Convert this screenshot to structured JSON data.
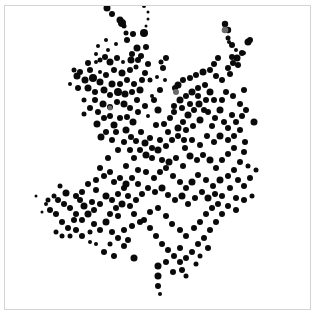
{
  "chart_data": {
    "type": "scatter",
    "title": "",
    "xlabel": "",
    "ylabel": "",
    "grid": false,
    "legend": null,
    "axes_visible": false,
    "frame": {
      "x": 4,
      "y": 5,
      "width": 307,
      "height": 305,
      "border_color": "#d4d4d4"
    },
    "marker_color": "#0a0a0a",
    "highlight_color": "#6a6a6a",
    "xlim": [
      0,
      317
    ],
    "ylim": [
      0,
      315
    ],
    "points": [
      [
        107,
        8,
        3.5
      ],
      [
        112,
        14,
        3
      ],
      [
        120,
        20,
        3.5
      ],
      [
        124,
        26,
        2.5
      ],
      [
        144,
        6,
        2
      ],
      [
        148,
        12,
        1.5
      ],
      [
        148,
        19,
        1.5
      ],
      [
        146,
        26,
        1.5
      ],
      [
        122,
        23,
        4
      ],
      [
        144,
        33,
        4
      ],
      [
        127,
        40,
        3
      ],
      [
        126,
        33,
        2.5
      ],
      [
        133,
        34,
        3
      ],
      [
        137,
        48,
        3.5
      ],
      [
        146,
        47,
        3
      ],
      [
        141,
        56,
        3
      ],
      [
        132,
        54,
        3
      ],
      [
        131,
        60,
        3.5
      ],
      [
        138,
        60,
        3
      ],
      [
        148,
        64,
        3
      ],
      [
        123,
        62,
        2
      ],
      [
        98,
        46,
        2
      ],
      [
        108,
        50,
        2
      ],
      [
        117,
        58,
        3
      ],
      [
        96,
        62,
        2
      ],
      [
        80,
        72,
        3
      ],
      [
        77,
        76,
        3.5
      ],
      [
        88,
        63,
        3
      ],
      [
        90,
        70,
        3
      ],
      [
        100,
        60,
        2.5
      ],
      [
        105,
        57,
        3
      ],
      [
        110,
        62,
        3.5
      ],
      [
        114,
        70,
        3
      ],
      [
        122,
        73,
        3.5
      ],
      [
        130,
        70,
        3
      ],
      [
        136,
        67,
        2.5
      ],
      [
        145,
        73,
        3
      ],
      [
        142,
        80,
        3
      ],
      [
        150,
        80,
        2.5
      ],
      [
        85,
        80,
        3.5
      ],
      [
        93,
        78,
        4
      ],
      [
        100,
        82,
        3.5
      ],
      [
        106,
        75,
        3
      ],
      [
        112,
        84,
        3.5
      ],
      [
        120,
        84,
        3
      ],
      [
        127,
        80,
        3
      ],
      [
        134,
        84,
        3
      ],
      [
        88,
        88,
        3.5
      ],
      [
        95,
        92,
        3
      ],
      [
        104,
        90,
        3.5
      ],
      [
        110,
        95,
        3
      ],
      [
        118,
        92,
        4
      ],
      [
        125,
        94,
        3.5
      ],
      [
        132,
        92,
        3
      ],
      [
        140,
        90,
        3.5
      ],
      [
        95,
        100,
        3
      ],
      [
        103,
        104,
        3.5
      ],
      [
        110,
        107,
        3
      ],
      [
        117,
        102,
        3
      ],
      [
        124,
        104,
        3.5
      ],
      [
        130,
        108,
        3
      ],
      [
        137,
        100,
        3
      ],
      [
        98,
        112,
        3
      ],
      [
        104,
        118,
        3
      ],
      [
        97,
        124,
        3.5
      ],
      [
        110,
        116,
        3
      ],
      [
        114,
        125,
        3.5
      ],
      [
        120,
        118,
        3
      ],
      [
        127,
        117,
        3
      ],
      [
        133,
        122,
        3.5
      ],
      [
        138,
        112,
        3
      ],
      [
        145,
        106,
        3
      ],
      [
        101,
        137,
        3.5
      ],
      [
        126,
        130,
        3.5
      ],
      [
        131,
        137,
        3
      ],
      [
        136,
        141,
        3
      ],
      [
        141,
        132,
        3
      ],
      [
        145,
        143,
        3.5
      ],
      [
        150,
        138,
        3
      ],
      [
        140,
        150,
        3
      ],
      [
        146,
        155,
        3.5
      ],
      [
        152,
        158,
        3
      ],
      [
        158,
        150,
        3.5
      ],
      [
        162,
        160,
        3
      ],
      [
        156,
        125,
        3
      ],
      [
        158,
        110,
        3.5
      ],
      [
        154,
        100,
        3
      ],
      [
        160,
        90,
        3
      ],
      [
        163,
        68,
        3
      ],
      [
        161,
        62,
        2.5
      ],
      [
        166,
        58,
        3
      ],
      [
        165,
        80,
        2
      ],
      [
        157,
        77,
        2
      ],
      [
        175,
        88,
        3
      ],
      [
        178,
        85,
        3.5
      ],
      [
        183,
        80,
        3
      ],
      [
        190,
        78,
        3
      ],
      [
        196,
        75,
        3
      ],
      [
        203,
        72,
        3.5
      ],
      [
        210,
        70,
        3
      ],
      [
        214,
        64,
        3
      ],
      [
        218,
        58,
        3
      ],
      [
        216,
        76,
        3
      ],
      [
        222,
        80,
        3
      ],
      [
        228,
        68,
        3
      ],
      [
        233,
        63,
        3
      ],
      [
        237,
        58,
        3.5
      ],
      [
        242,
        53,
        3
      ],
      [
        248,
        42,
        3.5
      ],
      [
        250,
        40,
        3
      ],
      [
        244,
        53,
        2
      ],
      [
        236,
        50,
        2
      ],
      [
        229,
        42,
        2
      ],
      [
        228,
        30,
        3.2
      ],
      [
        225,
        24,
        3.2
      ],
      [
        228,
        38,
        2.5
      ],
      [
        232,
        45,
        3
      ],
      [
        232,
        57,
        3
      ],
      [
        238,
        65,
        3
      ],
      [
        230,
        74,
        3
      ],
      [
        174,
        106,
        3
      ],
      [
        180,
        100,
        3.5
      ],
      [
        186,
        96,
        3
      ],
      [
        192,
        92,
        3.5
      ],
      [
        198,
        88,
        3
      ],
      [
        205,
        85,
        3
      ],
      [
        210,
        92,
        3.5
      ],
      [
        214,
        100,
        3
      ],
      [
        206,
        100,
        3
      ],
      [
        199,
        104,
        3.5
      ],
      [
        194,
        110,
        3
      ],
      [
        188,
        115,
        3.5
      ],
      [
        183,
        122,
        3
      ],
      [
        178,
        128,
        3.5
      ],
      [
        186,
        130,
        3
      ],
      [
        193,
        126,
        3
      ],
      [
        200,
        120,
        3.5
      ],
      [
        208,
        112,
        3
      ],
      [
        215,
        118,
        3
      ],
      [
        220,
        110,
        3.5
      ],
      [
        222,
        100,
        3
      ],
      [
        226,
        92,
        3
      ],
      [
        233,
        96,
        3
      ],
      [
        240,
        104,
        3
      ],
      [
        244,
        90,
        3
      ],
      [
        254,
        122,
        3.5
      ],
      [
        232,
        115,
        3
      ],
      [
        240,
        130,
        3
      ],
      [
        228,
        128,
        3
      ],
      [
        220,
        136,
        3.5
      ],
      [
        214,
        142,
        3
      ],
      [
        207,
        136,
        3
      ],
      [
        200,
        145,
        3
      ],
      [
        192,
        140,
        3
      ],
      [
        185,
        148,
        3
      ],
      [
        190,
        156,
        3.5
      ],
      [
        197,
        160,
        3
      ],
      [
        203,
        155,
        3
      ],
      [
        210,
        160,
        3.5
      ],
      [
        216,
        168,
        3
      ],
      [
        222,
        160,
        3
      ],
      [
        228,
        154,
        3
      ],
      [
        234,
        148,
        3
      ],
      [
        245,
        142,
        3
      ],
      [
        244,
        152,
        3
      ],
      [
        240,
        162,
        3
      ],
      [
        234,
        170,
        3
      ],
      [
        228,
        176,
        3
      ],
      [
        220,
        180,
        3.5
      ],
      [
        213,
        186,
        3
      ],
      [
        206,
        180,
        3
      ],
      [
        198,
        175,
        3
      ],
      [
        192,
        182,
        3.5
      ],
      [
        186,
        188,
        3
      ],
      [
        180,
        182,
        3
      ],
      [
        173,
        176,
        3
      ],
      [
        166,
        168,
        3
      ],
      [
        169,
        162,
        3.5
      ],
      [
        176,
        158,
        3
      ],
      [
        183,
        166,
        3
      ],
      [
        160,
        172,
        3
      ],
      [
        154,
        178,
        3
      ],
      [
        148,
        188,
        3
      ],
      [
        155,
        192,
        3
      ],
      [
        162,
        188,
        3.5
      ],
      [
        168,
        195,
        3
      ],
      [
        175,
        200,
        3
      ],
      [
        182,
        196,
        3.5
      ],
      [
        188,
        204,
        3
      ],
      [
        195,
        198,
        3
      ],
      [
        202,
        192,
        3
      ],
      [
        208,
        198,
        3.5
      ],
      [
        215,
        194,
        3
      ],
      [
        222,
        196,
        3
      ],
      [
        230,
        188,
        3
      ],
      [
        238,
        180,
        3
      ],
      [
        244,
        186,
        3
      ],
      [
        236,
        198,
        3
      ],
      [
        228,
        206,
        3
      ],
      [
        222,
        214,
        3
      ],
      [
        216,
        222,
        3
      ],
      [
        210,
        230,
        3
      ],
      [
        204,
        238,
        3
      ],
      [
        198,
        244,
        3
      ],
      [
        192,
        252,
        3
      ],
      [
        186,
        258,
        3
      ],
      [
        180,
        262,
        3
      ],
      [
        174,
        256,
        3
      ],
      [
        168,
        250,
        3
      ],
      [
        162,
        244,
        3
      ],
      [
        156,
        236,
        3
      ],
      [
        150,
        228,
        3
      ],
      [
        144,
        220,
        3
      ],
      [
        150,
        212,
        3
      ],
      [
        158,
        208,
        3
      ],
      [
        166,
        216,
        3
      ],
      [
        172,
        224,
        3
      ],
      [
        180,
        230,
        3
      ],
      [
        186,
        236,
        3
      ],
      [
        194,
        228,
        3
      ],
      [
        200,
        222,
        3
      ],
      [
        206,
        214,
        3
      ],
      [
        212,
        208,
        3
      ],
      [
        218,
        204,
        3
      ],
      [
        236,
        210,
        3
      ],
      [
        244,
        200,
        3
      ],
      [
        252,
        196,
        2.5
      ],
      [
        256,
        170,
        2.5
      ],
      [
        250,
        178,
        3
      ],
      [
        248,
        166,
        2.5
      ],
      [
        158,
        266,
        3.5
      ],
      [
        158,
        276,
        3.5
      ],
      [
        158,
        286,
        3
      ],
      [
        160,
        294,
        2
      ],
      [
        173,
        272,
        3
      ],
      [
        166,
        262,
        3
      ],
      [
        180,
        248,
        3
      ],
      [
        196,
        264,
        2.5
      ],
      [
        200,
        256,
        2.5
      ],
      [
        208,
        248,
        3
      ],
      [
        186,
        276,
        2.5
      ],
      [
        182,
        270,
        3
      ],
      [
        106,
        222,
        3.5
      ],
      [
        110,
        214,
        3
      ],
      [
        116,
        208,
        3
      ],
      [
        122,
        204,
        3.5
      ],
      [
        128,
        196,
        3
      ],
      [
        124,
        188,
        3
      ],
      [
        118,
        194,
        3
      ],
      [
        112,
        200,
        3
      ],
      [
        106,
        196,
        3.5
      ],
      [
        100,
        204,
        3
      ],
      [
        94,
        210,
        3
      ],
      [
        88,
        214,
        3.5
      ],
      [
        82,
        220,
        3
      ],
      [
        76,
        214,
        3
      ],
      [
        70,
        208,
        3
      ],
      [
        64,
        204,
        3
      ],
      [
        58,
        200,
        3
      ],
      [
        54,
        196,
        2.5
      ],
      [
        66,
        193,
        3.5
      ],
      [
        80,
        200,
        3
      ],
      [
        92,
        202,
        3
      ],
      [
        84,
        206,
        3.5
      ],
      [
        74,
        220,
        3
      ],
      [
        68,
        228,
        3
      ],
      [
        62,
        222,
        3
      ],
      [
        56,
        214,
        3
      ],
      [
        50,
        210,
        3
      ],
      [
        48,
        200,
        2.5
      ],
      [
        60,
        186,
        2.5
      ],
      [
        104,
        176,
        3
      ],
      [
        110,
        172,
        3
      ],
      [
        114,
        182,
        3
      ],
      [
        120,
        178,
        3
      ],
      [
        126,
        184,
        3.5
      ],
      [
        132,
        178,
        3
      ],
      [
        138,
        184,
        3
      ],
      [
        142,
        194,
        3
      ],
      [
        136,
        200,
        3
      ],
      [
        130,
        206,
        3
      ],
      [
        134,
        214,
        3
      ],
      [
        140,
        222,
        3
      ],
      [
        132,
        226,
        3
      ],
      [
        124,
        230,
        3
      ],
      [
        118,
        238,
        3
      ],
      [
        112,
        232,
        3
      ],
      [
        100,
        230,
        3
      ],
      [
        94,
        224,
        3
      ],
      [
        90,
        232,
        2.5
      ],
      [
        82,
        236,
        3
      ],
      [
        76,
        230,
        3
      ],
      [
        70,
        236,
        2.5
      ],
      [
        62,
        236,
        2.5
      ],
      [
        56,
        232,
        2.5
      ],
      [
        124,
        246,
        3
      ],
      [
        134,
        258,
        3.5
      ],
      [
        118,
        216,
        3
      ],
      [
        96,
        190,
        3
      ],
      [
        126,
        166,
        3
      ],
      [
        134,
        158,
        3
      ],
      [
        138,
        170,
        3
      ],
      [
        146,
        172,
        3
      ],
      [
        128,
        240,
        3
      ],
      [
        110,
        244,
        2.5
      ],
      [
        104,
        252,
        3
      ],
      [
        114,
        256,
        3
      ],
      [
        96,
        244,
        2
      ],
      [
        90,
        242,
        2
      ],
      [
        36,
        196,
        1.5
      ],
      [
        46,
        204,
        2
      ],
      [
        42,
        212,
        1.5
      ],
      [
        172,
        140,
        3
      ],
      [
        178,
        136,
        3
      ],
      [
        184,
        140,
        3
      ],
      [
        166,
        146,
        3
      ],
      [
        160,
        140,
        3
      ],
      [
        152,
        148,
        3
      ],
      [
        170,
        118,
        3
      ],
      [
        164,
        124,
        3
      ],
      [
        168,
        132,
        3
      ],
      [
        174,
        112,
        3
      ],
      [
        182,
        108,
        3
      ],
      [
        190,
        104,
        3
      ],
      [
        198,
        96,
        3
      ],
      [
        204,
        110,
        3
      ],
      [
        212,
        126,
        3
      ],
      [
        224,
        122,
        3
      ],
      [
        236,
        122,
        3
      ],
      [
        242,
        116,
        3
      ],
      [
        246,
        110,
        3
      ],
      [
        228,
        140,
        3
      ],
      [
        234,
        136,
        3
      ],
      [
        90,
        108,
        3
      ],
      [
        84,
        114,
        2.5
      ],
      [
        84,
        100,
        2.5
      ],
      [
        78,
        88,
        3
      ],
      [
        74,
        70,
        2.5
      ],
      [
        70,
        84,
        2
      ],
      [
        100,
        72,
        2
      ],
      [
        116,
        44,
        2
      ],
      [
        106,
        40,
        2
      ],
      [
        96,
        54,
        2
      ],
      [
        152,
        96,
        2
      ],
      [
        148,
        116,
        2
      ],
      [
        118,
        150,
        3
      ],
      [
        112,
        140,
        3
      ],
      [
        106,
        132,
        3
      ],
      [
        116,
        132,
        3
      ],
      [
        124,
        142,
        3
      ],
      [
        130,
        150,
        3
      ],
      [
        108,
        158,
        3
      ],
      [
        100,
        168,
        3
      ],
      [
        96,
        180,
        3
      ],
      [
        88,
        184,
        3
      ],
      [
        82,
        192,
        3
      ],
      [
        76,
        196,
        3
      ]
    ],
    "highlight_points": [
      [
        225,
        30,
        3.3
      ],
      [
        176,
        92,
        3
      ],
      [
        110,
        108,
        2.5
      ]
    ]
  }
}
